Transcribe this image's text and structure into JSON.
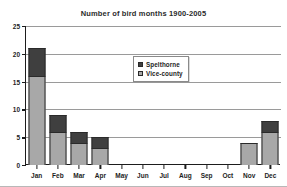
{
  "chart_data": {
    "type": "bar",
    "title": "Number of bird months 1900-2005",
    "xlabel": "",
    "ylabel": "",
    "ylim": [
      0,
      25
    ],
    "yticks": [
      0,
      5,
      10,
      15,
      20,
      25
    ],
    "grid": true,
    "stacked": true,
    "legend_position": "inside-top-center",
    "categories": [
      "Jan",
      "Feb",
      "Mar",
      "Apr",
      "May",
      "Jun",
      "Jul",
      "Aug",
      "Sep",
      "Oct",
      "Nov",
      "Dec"
    ],
    "series": [
      {
        "name": "Vice-county",
        "color": "#a8a8a8",
        "values": [
          16,
          6,
          4,
          3,
          0,
          0,
          0,
          0,
          0,
          0,
          4,
          6
        ]
      },
      {
        "name": "Spelthorne",
        "color": "#3f3f3f",
        "values": [
          5,
          3,
          2,
          2,
          0,
          0,
          0,
          0,
          0,
          0,
          0,
          2
        ]
      }
    ],
    "totals": [
      21,
      9,
      6,
      5,
      0,
      0,
      0,
      0,
      0,
      0,
      4,
      8
    ]
  },
  "legend": {
    "entries": [
      {
        "label": "Spelthorne",
        "swatch": "dark"
      },
      {
        "label": "Vice-county",
        "swatch": "light"
      }
    ]
  },
  "colors": {
    "spelthorne": "#3f3f3f",
    "vice_county": "#a8a8a8",
    "axis": "#1d1d1d",
    "gridline": "#9a9a9a",
    "background": "#ffffff"
  }
}
